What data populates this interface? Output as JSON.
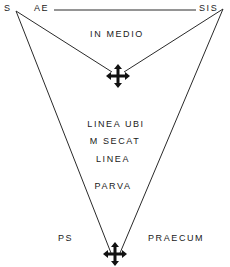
{
  "labels": {
    "top_left_corner": "S",
    "top_left_tag": "AE",
    "top_right_tag": "SIS",
    "upper_region": "IN  MEDIO",
    "middle_line1": "LINEA  UBI",
    "middle_line2": "M  SECAT",
    "middle_line3": "LINEA",
    "middle_line4": "PARVA",
    "bottom_left": "PS",
    "bottom_right": "PRAECUM"
  },
  "icons": {
    "upper": "move-arrows-icon",
    "lower": "move-arrows-icon"
  },
  "colors": {
    "line": "#2a2a2a",
    "text": "#1a1a1a",
    "background": "#ffffff"
  }
}
